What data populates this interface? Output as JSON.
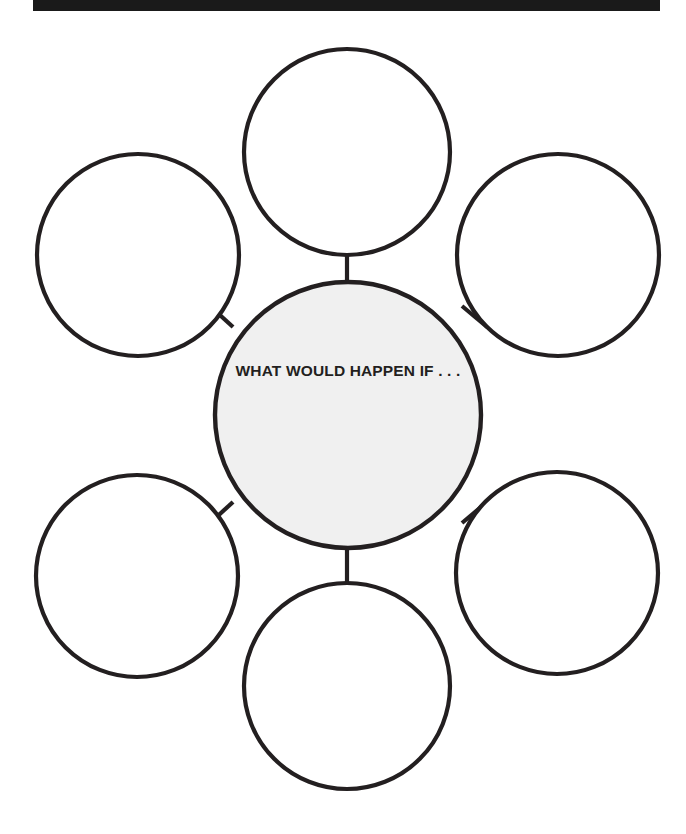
{
  "page": {
    "width": 686,
    "height": 834,
    "background_color": "#ffffff",
    "type": "graphic-organizer-worksheet"
  },
  "banner": {
    "label": "WHAT WOULD HAPPEN IF . . .",
    "background_color": "#1a1a1a",
    "text_color": "#ffffff",
    "note": "clipped at top edge of screenshot"
  },
  "organizer": {
    "center": {
      "label": "WHAT WOULD HAPPEN IF . . .",
      "fill_color": "#f0f0f0",
      "stroke_color": "#231f20",
      "cx": 348,
      "cy": 415,
      "r": 133
    },
    "stroke_color": "#231f20",
    "bubble_fill_color": "#ffffff",
    "bubbles": [
      {
        "name": "bubble-top",
        "label": "",
        "cx": 347,
        "cy": 152,
        "r": 103
      },
      {
        "name": "bubble-upper-right",
        "label": "",
        "cx": 558,
        "cy": 255,
        "r": 101
      },
      {
        "name": "bubble-lower-right",
        "label": "",
        "cx": 557,
        "cy": 573,
        "r": 101
      },
      {
        "name": "bubble-bottom",
        "label": "",
        "cx": 347,
        "cy": 686,
        "r": 103
      },
      {
        "name": "bubble-lower-left",
        "label": "",
        "cx": 137,
        "cy": 576,
        "r": 101
      },
      {
        "name": "bubble-upper-left",
        "label": "",
        "cx": 138,
        "cy": 255,
        "r": 101
      }
    ],
    "connectors": [
      {
        "name": "connector-top",
        "x1": 347,
        "y1": 255,
        "x2": 347,
        "y2": 282
      },
      {
        "name": "connector-upper-right",
        "x1": 487,
        "y1": 327,
        "x2": 462,
        "y2": 306
      },
      {
        "name": "connector-lower-right",
        "x1": 462,
        "y1": 523,
        "x2": 487,
        "y2": 502
      },
      {
        "name": "connector-bottom",
        "x1": 347,
        "y1": 548,
        "x2": 347,
        "y2": 583
      },
      {
        "name": "connector-lower-left",
        "x1": 233,
        "y1": 502,
        "x2": 210,
        "y2": 523
      },
      {
        "name": "connector-upper-left",
        "x1": 210,
        "y1": 306,
        "x2": 233,
        "y2": 327
      }
    ]
  }
}
